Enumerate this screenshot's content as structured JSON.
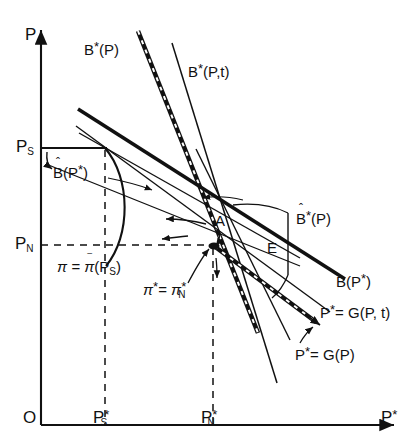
{
  "figure": {
    "type": "economic-schematic-diagram",
    "background": "#ffffff",
    "ink": "#111111",
    "width": 417,
    "height": 438
  },
  "axes": {
    "y_axis_label": "P",
    "x_axis_label": "P*",
    "origin_label": "O",
    "y_ticks": [
      {
        "id": "PS",
        "base": "P",
        "sub": "S",
        "y_px": 148
      },
      {
        "id": "PN",
        "base": "P",
        "sub": "N",
        "y_px": 245
      }
    ],
    "x_ticks": [
      {
        "id": "PSstar",
        "base": "P",
        "sub": "S",
        "star": "*",
        "x_px": 105
      },
      {
        "id": "PNstar",
        "base": "P",
        "sub": "N",
        "star": "*",
        "x_px": 213
      }
    ]
  },
  "curves": [
    {
      "name": "B-star-of-P",
      "label": "B*(P)",
      "style": "thick-dashed-steep"
    },
    {
      "name": "B-star-of-P-t",
      "label": "B*(P,t)",
      "style": "thin-steep"
    },
    {
      "name": "B-hat-of-P-star",
      "label": "B(P*)",
      "hat": true,
      "style": "thin-shallow"
    },
    {
      "name": "B-hat-star-of-P",
      "label": "B*(P)",
      "hat": true,
      "style": "thin-steep-right"
    },
    {
      "name": "B-of-P-star",
      "label": "B(P*)",
      "style": "thick-shallow"
    },
    {
      "name": "P-star-eq-G-of-P-t",
      "label": "P*= G(P, t)",
      "style": "thin-medium"
    },
    {
      "name": "P-star-eq-G-of-P",
      "label": "P*= G(P)",
      "style": "thick-dashed-medium"
    }
  ],
  "points": [
    {
      "name": "point-A",
      "label": "A",
      "x_px": 221,
      "y_px": 222
    },
    {
      "name": "point-E",
      "label": "E",
      "x_px": 272,
      "y_px": 248
    }
  ],
  "annotations": [
    {
      "name": "pi-bar-annotation",
      "label": "π = π (P",
      "overbar_on": "π",
      "sub": "S",
      "tail": ")"
    },
    {
      "name": "pi-star-annotation",
      "label": "π* = π",
      "sub": "N",
      "stars": [
        "*",
        "*"
      ]
    }
  ],
  "text": {
    "y_axis": "P",
    "x_axis_base": "P",
    "x_axis_star": "*",
    "origin": "O",
    "PS_base": "P",
    "PS_sub": "S",
    "PN_base": "P",
    "PN_sub": "N",
    "PSstar_base": "P",
    "PSstar_sub": "S",
    "PSstar_star": "*",
    "PNstar_base": "P",
    "PNstar_sub": "N",
    "PNstar_star": "*",
    "Bstar_P_base": "B",
    "Bstar_P_star": "*",
    "Bstar_P_arg": "(P)",
    "Bstar_Pt_base": "B",
    "Bstar_Pt_star": "*",
    "Bstar_Pt_arg": "(P,t)",
    "Bhat_Pstar_base": "B",
    "Bhat_Pstar_hat": "ˆ",
    "Bhat_Pstar_arg": "(P",
    "Bhat_Pstar_star": "*",
    "Bhat_Pstar_close": ")",
    "BhatStar_P_base": "B",
    "BhatStar_P_hat": "ˆ",
    "BhatStar_P_star": "*",
    "BhatStar_P_arg": "(P)",
    "B_Pstar_base": "B(P",
    "B_Pstar_star": "*",
    "B_Pstar_close": ")",
    "G_Pt_base": "P",
    "G_Pt_star": "*",
    "G_Pt_rest": "= G(P, t)",
    "G_P_base": "P",
    "G_P_star": "*",
    "G_P_rest": "= G(P)",
    "point_A": "A",
    "point_E": "E",
    "pi_eq": "π =",
    "pi_bar": "π",
    "pi_bar_mark": "‾",
    "pi_bar_arg_open": "(P",
    "pi_bar_sub": "S",
    "pi_bar_close": ")",
    "pistar_base": "π",
    "pistar_star1": "*",
    "pistar_eq": "=",
    "pistar_base2": "π",
    "pistar_star2": "*",
    "pistar_sub": "N"
  }
}
